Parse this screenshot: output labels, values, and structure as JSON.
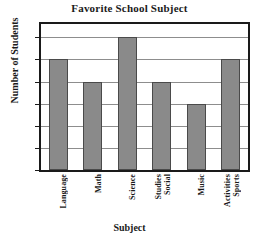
{
  "chart_data": {
    "type": "bar",
    "title": "Favorite School Subject",
    "xlabel": "Subject",
    "ylabel": "Number of Students",
    "categories": [
      "Language",
      "Math",
      "Science",
      "Social Studies",
      "Music",
      "Sports Activities"
    ],
    "category_lines": [
      [
        "Language"
      ],
      [
        "Math"
      ],
      [
        "Science"
      ],
      [
        "Social",
        "Studies"
      ],
      [
        "Music"
      ],
      [
        "Sports",
        "Activities"
      ]
    ],
    "values": [
      25,
      20,
      30,
      20,
      15,
      25
    ],
    "ylim": [
      0,
      33
    ],
    "yticks": [
      0,
      5,
      10,
      15,
      20,
      25,
      30
    ],
    "ytick_labels": [
      "0",
      "5",
      "10",
      "15",
      "20",
      "25",
      "30"
    ],
    "grid": true,
    "grid_axis": "y",
    "legend": null,
    "bar_color": "#8a8a8a",
    "bar_edge_color": "#4a4a4a",
    "grid_color": "#8d8d8d",
    "frame_color": "#1a1a1a",
    "background": "#ffffff"
  }
}
